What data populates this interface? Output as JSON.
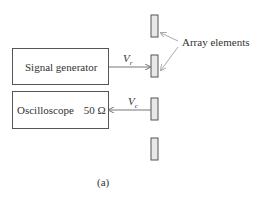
{
  "diagram": {
    "blocks": {
      "signal_generator": {
        "label": "Signal generator"
      },
      "oscilloscope": {
        "label": "Oscilloscope",
        "impedance": "50 Ω"
      }
    },
    "signals": {
      "transmit": {
        "symbol": "V",
        "subscript": "r"
      },
      "receive": {
        "symbol": "V",
        "subscript": "c"
      }
    },
    "annotation": "Array elements",
    "caption": "(a)",
    "array_element_count": 4,
    "colors": {
      "line": "#666666",
      "element_fill": "#e6e6e6",
      "arrow": "#999999"
    }
  }
}
